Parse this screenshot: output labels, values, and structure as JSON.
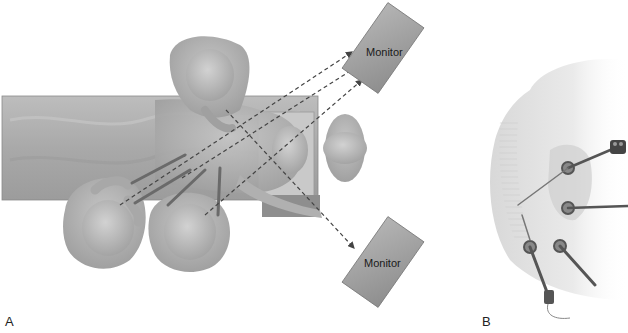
{
  "figure": {
    "panels": [
      {
        "id": "A",
        "label": "A",
        "description": "Overhead view of operating room setup with patient on table, surgical team and two monitors",
        "monitors": [
          {
            "label": "Monitor",
            "position": "top-right"
          },
          {
            "label": "Monitor",
            "position": "bottom-right"
          }
        ],
        "sight_lines": "dashed arrows from surgeons to monitors"
      },
      {
        "id": "B",
        "label": "B",
        "description": "Lateral torso view showing trocar port placement with instruments and camera"
      }
    ]
  },
  "colors": {
    "figure_gray": "#b8b8b8",
    "table_gray": "#a8a8a8",
    "monitor_gray": "#a0a0a0",
    "dash_line": "#444444",
    "background": "#ffffff"
  }
}
